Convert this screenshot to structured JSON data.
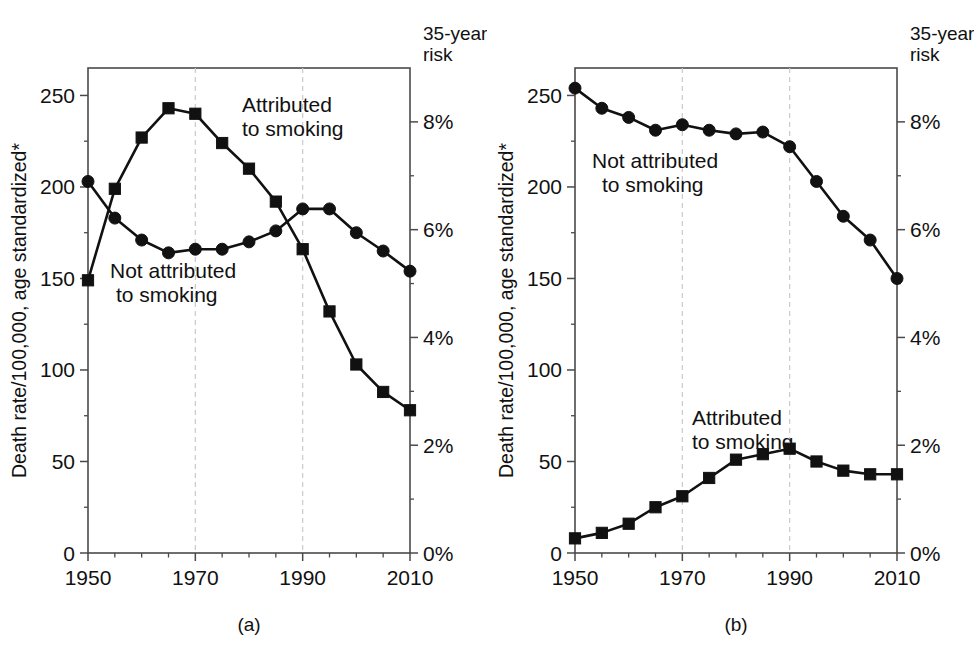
{
  "figure": {
    "panels": [
      {
        "id": "a",
        "panel_label": "(a)",
        "y_axis_title": "Death rate/100,000, age standardized*",
        "right_axis_header_line1": "35-year",
        "right_axis_header_line2": "risk",
        "series_label_squares_line1": "Attributed",
        "series_label_squares_line2": "to smoking",
        "series_label_circles_line1": "Not attributed",
        "series_label_circles_line2": "to smoking"
      },
      {
        "id": "b",
        "panel_label": "(b)",
        "y_axis_title": "Death rate/100,000, age standardized*",
        "right_axis_header_line1": "35-year",
        "right_axis_header_line2": "risk",
        "series_label_squares_line1": "Attributed",
        "series_label_squares_line2": "to smoking",
        "series_label_circles_line1": "Not attributed",
        "series_label_circles_line2": "to smoking"
      }
    ]
  },
  "chart_data": [
    {
      "type": "line",
      "id": "a",
      "title": "(a)",
      "xlabel": "",
      "ylabel": "Death rate/100,000, age standardized*",
      "y2label": "35-year risk",
      "xlim": [
        1950,
        2010
      ],
      "ylim": [
        0,
        265
      ],
      "y2lim": [
        0,
        9.0
      ],
      "yticks": [
        0,
        50,
        100,
        150,
        200,
        250
      ],
      "ytick_labels": [
        "0",
        "50",
        "100",
        "150",
        "200",
        "250"
      ],
      "y2ticks": [
        0,
        2,
        4,
        6,
        8
      ],
      "y2tick_labels": [
        "0%",
        "2%",
        "4%",
        "6%",
        "8%"
      ],
      "xticks": [
        1950,
        1970,
        1990,
        2010
      ],
      "xtick_labels": [
        "1950",
        "1970",
        "1990",
        "2010"
      ],
      "xticks_minor": [
        1955,
        1960,
        1965,
        1975,
        1980,
        1985,
        1995,
        2000,
        2005
      ],
      "grid": false,
      "vertical_guides": [
        1970,
        1990
      ],
      "legend_position": "inline-annotation",
      "x": [
        1950,
        1955,
        1960,
        1965,
        1970,
        1975,
        1980,
        1985,
        1990,
        1995,
        2000,
        2005,
        2010
      ],
      "series": [
        {
          "name": "Attributed to smoking",
          "marker": "square",
          "values": [
            149,
            199,
            227,
            243,
            240,
            224,
            210,
            192,
            166,
            132,
            103,
            88,
            78
          ]
        },
        {
          "name": "Not attributed to smoking",
          "marker": "circle",
          "values": [
            203,
            183,
            171,
            164,
            166,
            166,
            170,
            176,
            188,
            188,
            175,
            165,
            154
          ]
        }
      ]
    },
    {
      "type": "line",
      "id": "b",
      "title": "(b)",
      "xlabel": "",
      "ylabel": "Death rate/100,000, age standardized*",
      "y2label": "35-year risk",
      "xlim": [
        1950,
        2010
      ],
      "ylim": [
        0,
        265
      ],
      "y2lim": [
        0,
        9.0
      ],
      "yticks": [
        0,
        50,
        100,
        150,
        200,
        250
      ],
      "ytick_labels": [
        "0",
        "50",
        "100",
        "150",
        "200",
        "250"
      ],
      "y2ticks": [
        0,
        2,
        4,
        6,
        8
      ],
      "y2tick_labels": [
        "0%",
        "2%",
        "4%",
        "6%",
        "8%"
      ],
      "xticks": [
        1950,
        1970,
        1990,
        2010
      ],
      "xtick_labels": [
        "1950",
        "1970",
        "1990",
        "2010"
      ],
      "xticks_minor": [
        1955,
        1960,
        1965,
        1975,
        1980,
        1985,
        1995,
        2000,
        2005
      ],
      "grid": false,
      "vertical_guides": [
        1970,
        1990
      ],
      "legend_position": "inline-annotation",
      "x": [
        1950,
        1955,
        1960,
        1965,
        1970,
        1975,
        1980,
        1985,
        1990,
        1995,
        2000,
        2005,
        2010
      ],
      "series": [
        {
          "name": "Not attributed to smoking",
          "marker": "circle",
          "values": [
            254,
            243,
            238,
            231,
            234,
            231,
            229,
            230,
            222,
            203,
            184,
            171,
            150
          ]
        },
        {
          "name": "Attributed to smoking",
          "marker": "square",
          "values": [
            8,
            11,
            16,
            25,
            31,
            41,
            51,
            54,
            57,
            50,
            45,
            43,
            43
          ]
        }
      ]
    }
  ]
}
